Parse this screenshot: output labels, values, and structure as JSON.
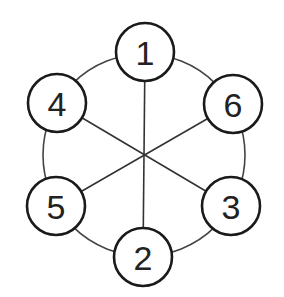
{
  "diagram": {
    "type": "graph",
    "ring": {
      "cx": 144,
      "cy": 155,
      "r": 101
    },
    "hub": {
      "x": 144,
      "y": 155
    },
    "nodes": [
      {
        "id": "n1",
        "label": "1",
        "cx": 145,
        "cy": 52,
        "r": 29
      },
      {
        "id": "n6",
        "label": "6",
        "cx": 233,
        "cy": 104,
        "r": 29
      },
      {
        "id": "n3",
        "label": "3",
        "cx": 231,
        "cy": 206,
        "r": 29
      },
      {
        "id": "n2",
        "label": "2",
        "cx": 143,
        "cy": 257,
        "r": 29
      },
      {
        "id": "n5",
        "label": "5",
        "cx": 56,
        "cy": 206,
        "r": 29
      },
      {
        "id": "n4",
        "label": "4",
        "cx": 57,
        "cy": 103,
        "r": 29
      }
    ],
    "spokes": [
      {
        "from": "1",
        "to": "2"
      },
      {
        "from": "4",
        "to": "3"
      },
      {
        "from": "6",
        "to": "5"
      }
    ],
    "colors": {
      "background": "#ffffff",
      "stroke": "#1a1a1a",
      "line": "#333333",
      "text": "#222222"
    }
  }
}
